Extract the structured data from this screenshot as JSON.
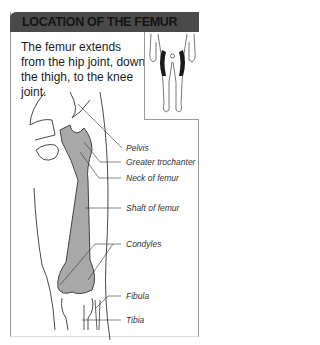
{
  "header": {
    "title": "LOCATION OF THE FEMUR"
  },
  "intro": {
    "text": "The femur extends from the hip joint, down the thigh, to the knee joint."
  },
  "labels": [
    {
      "text": "Pelvis"
    },
    {
      "text": "Greater trochanter"
    },
    {
      "text": "Neck of femur"
    },
    {
      "text": "Shaft of femur"
    },
    {
      "text": "Condyles"
    },
    {
      "text": "Fibula"
    },
    {
      "text": "Tibia"
    }
  ],
  "colors": {
    "header_bg": "#4a4a4a",
    "bone_fill": "#a8a8a8",
    "highlight": "#1a1a1a"
  }
}
